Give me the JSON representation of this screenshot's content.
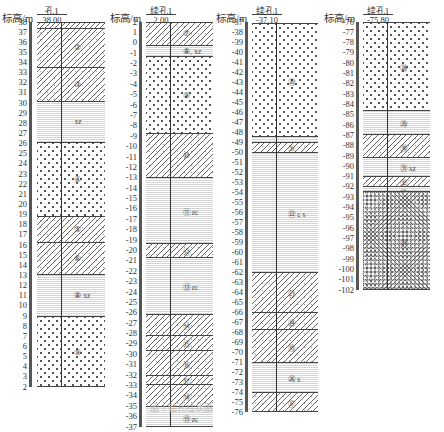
{
  "figure": {
    "y_axis_label": "标高/m",
    "caption": "图 1 钻孔柱状图"
  },
  "columns": [
    {
      "hole_name": "孔1",
      "top_elevation": "38.00",
      "ticks": [
        "38",
        "37",
        "36",
        "35",
        "34",
        "33",
        "32",
        "31",
        "30",
        "29",
        "28",
        "27",
        "26",
        "25",
        "24",
        "23",
        "22",
        "21",
        "20",
        "19",
        "18",
        "17",
        "16",
        "15",
        "14",
        "13",
        "12",
        "11",
        "10",
        "9",
        "8",
        "7",
        "6",
        "5",
        "4",
        "3",
        "2"
      ],
      "layers": [
        {
          "top": 38.0,
          "bottom": 37.4,
          "pattern": "hatch2",
          "label": ""
        },
        {
          "top": 37.4,
          "bottom": 33.6,
          "pattern": "hatch",
          "label": "②"
        },
        {
          "top": 33.6,
          "bottom": 30.2,
          "pattern": "hatch",
          "label": "③"
        },
        {
          "top": 30.2,
          "bottom": 26.2,
          "pattern": "silt",
          "label": "xz"
        },
        {
          "top": 26.2,
          "bottom": 18.9,
          "pattern": "dots",
          "label": "④"
        },
        {
          "top": 18.9,
          "bottom": 16.3,
          "pattern": "hatch",
          "label": "⑤"
        },
        {
          "top": 16.3,
          "bottom": 13.1,
          "pattern": "hatch",
          "label": "⑥"
        },
        {
          "top": 13.1,
          "bottom": 9.0,
          "pattern": "silt",
          "label": "⑧  xz"
        },
        {
          "top": 9.0,
          "bottom": 2.0,
          "pattern": "dots",
          "label": "⑨"
        }
      ]
    },
    {
      "hole_name": "续孔1",
      "top_elevation": "2.00",
      "ticks": [
        "2",
        "1",
        "0",
        "-1",
        "-2",
        "-3",
        "-4",
        "-5",
        "-6",
        "-7",
        "-8",
        "-9",
        "-10",
        "-11",
        "-12",
        "-13",
        "-14",
        "-15",
        "-16",
        "-17",
        "-18",
        "-19",
        "-20",
        "-21",
        "-22",
        "-23",
        "-24",
        "-25",
        "-26",
        "-27",
        "-28",
        "-29",
        "-30",
        "-31",
        "-32",
        "-33",
        "-34",
        "-35",
        "-36",
        "-37"
      ],
      "layers": [
        {
          "top": 2.0,
          "bottom": -0.2,
          "pattern": "hatch",
          "label": "⑦"
        },
        {
          "top": -0.2,
          "bottom": -1.3,
          "pattern": "silt",
          "label": "⑧₁  xz"
        },
        {
          "top": -1.3,
          "bottom": -8.7,
          "pattern": "dots",
          "label": "⑨"
        },
        {
          "top": -8.7,
          "bottom": -12.9,
          "pattern": "hatch",
          "label": "⑩"
        },
        {
          "top": -12.9,
          "bottom": -19.3,
          "pattern": "silt",
          "label": "⑪  zc"
        },
        {
          "top": -19.3,
          "bottom": -20.6,
          "pattern": "hatch",
          "label": "⑫"
        },
        {
          "top": -20.6,
          "bottom": -26.1,
          "pattern": "silt",
          "label": "⑬  zc"
        },
        {
          "top": -26.1,
          "bottom": -28.1,
          "pattern": "hatch",
          "label": "⑭"
        },
        {
          "top": -28.1,
          "bottom": -29.6,
          "pattern": "hatch",
          "label": "⑮"
        },
        {
          "top": -29.6,
          "bottom": -32.0,
          "pattern": "hatch",
          "label": "⑯"
        },
        {
          "top": -32.0,
          "bottom": -32.9,
          "pattern": "hatch",
          "label": "⑰"
        },
        {
          "top": -32.9,
          "bottom": -35.0,
          "pattern": "hatch",
          "label": "⑱"
        },
        {
          "top": -35.0,
          "bottom": -37.0,
          "pattern": "silt",
          "label": "⑲  zc"
        }
      ]
    },
    {
      "hole_name": "续孔1",
      "top_elevation": "-37.10",
      "ticks": [
        "-37",
        "-38",
        "-39",
        "-40",
        "-41",
        "-42",
        "-43",
        "-44",
        "-45",
        "-46",
        "-47",
        "-48",
        "-49",
        "-50",
        "-51",
        "-52",
        "-53",
        "-54",
        "-55",
        "-56",
        "-57",
        "-58",
        "-59",
        "-60",
        "-61",
        "-62",
        "-63",
        "-64",
        "-65",
        "-66",
        "-67",
        "-68",
        "-69",
        "-70",
        "-71",
        "-72",
        "-73",
        "-74",
        "-75",
        "-76"
      ],
      "layers": [
        {
          "top": -37.1,
          "bottom": -48.4,
          "pattern": "dots",
          "label": "⑳"
        },
        {
          "top": -48.4,
          "bottom": -49.0,
          "pattern": "silt",
          "label": ""
        },
        {
          "top": -49.0,
          "bottom": -50.0,
          "pattern": "hatch",
          "label": "㉑"
        },
        {
          "top": -50.0,
          "bottom": -62.0,
          "pattern": "silt",
          "label": "㉒  c s"
        },
        {
          "top": -62.0,
          "bottom": -66.0,
          "pattern": "hatch",
          "label": "㉓"
        },
        {
          "top": -66.0,
          "bottom": -67.7,
          "pattern": "hatch",
          "label": "㉔"
        },
        {
          "top": -67.7,
          "bottom": -71.0,
          "pattern": "hatch",
          "label": "㉕"
        },
        {
          "top": -71.0,
          "bottom": -74.0,
          "pattern": "silt",
          "label": "㉖  s"
        },
        {
          "top": -74.0,
          "bottom": -76.0,
          "pattern": "hatch",
          "label": "㉗"
        }
      ]
    },
    {
      "hole_name": "续孔1",
      "top_elevation": "-75.80",
      "ticks": [
        "-76",
        "-77",
        "-78",
        "-79",
        "-80",
        "-81",
        "-82",
        "-83",
        "-84",
        "-85",
        "-86",
        "-87",
        "-88",
        "-89",
        "-90",
        "-91",
        "-92",
        "-93",
        "-94",
        "-95",
        "-96",
        "-97",
        "-98",
        "-99",
        "-100",
        "-101",
        "-102"
      ],
      "layers": [
        {
          "top": -76.0,
          "bottom": -84.5,
          "pattern": "dots",
          "label": "㉘"
        },
        {
          "top": -84.5,
          "bottom": -86.9,
          "pattern": "silt",
          "label": "㉙"
        },
        {
          "top": -86.9,
          "bottom": -89.1,
          "pattern": "hatch",
          "label": "㉚"
        },
        {
          "top": -89.1,
          "bottom": -90.9,
          "pattern": "silt",
          "label": "㉛  xz"
        },
        {
          "top": -90.9,
          "bottom": -91.9,
          "pattern": "hatch",
          "label": "㉜"
        },
        {
          "top": -91.9,
          "bottom": -92.4,
          "pattern": "silt",
          "label": "㉝  s"
        },
        {
          "top": -92.4,
          "bottom": -102.0,
          "pattern": "gravel",
          "label": "㉞"
        }
      ]
    }
  ]
}
